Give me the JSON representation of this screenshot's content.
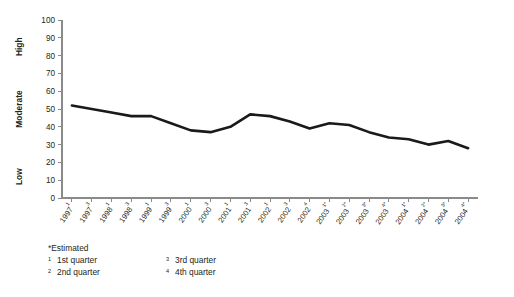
{
  "chart_data": {
    "type": "line",
    "title": "",
    "xlabel": "",
    "ylabel": "",
    "ylim": [
      0,
      100
    ],
    "grid": false,
    "legend_position": "none",
    "y_ticks": [
      0,
      10,
      20,
      30,
      40,
      50,
      60,
      70,
      80,
      90,
      100
    ],
    "y_category_labels": [
      {
        "text": "High",
        "value": 85
      },
      {
        "text": "Moderate",
        "value": 50
      },
      {
        "text": "Low",
        "value": 12
      }
    ],
    "categories": [
      "1997¹",
      "1997³",
      "1998¹",
      "1998³",
      "1999¹",
      "1999³",
      "2000¹",
      "2000³",
      "2001¹",
      "2001³",
      "2002¹",
      "2002³",
      "2002⁴",
      "2003¹*",
      "2003²*",
      "2003³*",
      "2003⁴*",
      "2004¹*",
      "2004²*",
      "2004³*",
      "2004⁴*"
    ],
    "category_parts": [
      {
        "year": "1997",
        "sup": "1",
        "est": false
      },
      {
        "year": "1997",
        "sup": "3",
        "est": false
      },
      {
        "year": "1998",
        "sup": "1",
        "est": false
      },
      {
        "year": "1998",
        "sup": "3",
        "est": false
      },
      {
        "year": "1999",
        "sup": "1",
        "est": false
      },
      {
        "year": "1999",
        "sup": "3",
        "est": false
      },
      {
        "year": "2000",
        "sup": "1",
        "est": false
      },
      {
        "year": "2000",
        "sup": "3",
        "est": false
      },
      {
        "year": "2001",
        "sup": "1",
        "est": false
      },
      {
        "year": "2001",
        "sup": "3",
        "est": false
      },
      {
        "year": "2002",
        "sup": "1",
        "est": false
      },
      {
        "year": "2002",
        "sup": "3",
        "est": false
      },
      {
        "year": "2002",
        "sup": "4",
        "est": false
      },
      {
        "year": "2003",
        "sup": "1",
        "est": true
      },
      {
        "year": "2003",
        "sup": "2",
        "est": true
      },
      {
        "year": "2003",
        "sup": "3",
        "est": true
      },
      {
        "year": "2003",
        "sup": "4",
        "est": true
      },
      {
        "year": "2004",
        "sup": "1",
        "est": true
      },
      {
        "year": "2004",
        "sup": "2",
        "est": true
      },
      {
        "year": "2004",
        "sup": "3",
        "est": true
      },
      {
        "year": "2004",
        "sup": "4",
        "est": true
      }
    ],
    "values": [
      52,
      50,
      48,
      46,
      46,
      42,
      38,
      37,
      40,
      47,
      46,
      43,
      39,
      42,
      41,
      37,
      34,
      33,
      30,
      32,
      28
    ],
    "series": [
      {
        "name": "Index",
        "color": "#1a1a1a",
        "values": [
          52,
          50,
          48,
          46,
          46,
          42,
          38,
          37,
          40,
          47,
          46,
          43,
          39,
          42,
          41,
          37,
          34,
          33,
          30,
          32,
          28
        ]
      }
    ]
  },
  "footnotes": {
    "estimated": "*Estimated",
    "items": [
      {
        "marker": "1",
        "text": "1st quarter"
      },
      {
        "marker": "3",
        "text": "3rd quarter"
      },
      {
        "marker": "2",
        "text": "2nd quarter"
      },
      {
        "marker": "4",
        "text": "4th quarter"
      }
    ]
  },
  "colors": {
    "line": "#1a1a1a",
    "axis": "#8a8a8a",
    "text": "#231f20",
    "background": "#ffffff"
  }
}
